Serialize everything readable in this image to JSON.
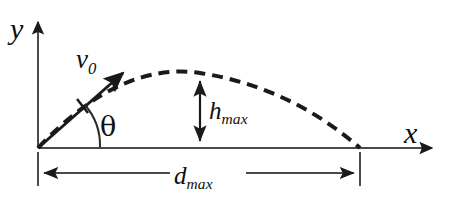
{
  "figure": {
    "background_color": "#ffffff",
    "stroke_color": "#3a3a3a",
    "label_color": "#101010",
    "width": 451,
    "height": 209
  },
  "axes": {
    "y_label": "y",
    "x_label": "x",
    "origin": {
      "x": 38,
      "y": 148
    },
    "y_axis_top": {
      "x": 38,
      "y": 15
    },
    "x_axis_right": {
      "x": 441,
      "y": 148
    }
  },
  "vectors": {
    "initial_velocity": {
      "label": "v",
      "subscript": "0",
      "angle_label": "θ",
      "tail": {
        "x": 38,
        "y": 148
      },
      "tip": {
        "x": 128,
        "y": 68
      },
      "angle_degrees": 41
    }
  },
  "dimensions": {
    "height": {
      "label": "h",
      "subscript": "max",
      "arrow_x": 200,
      "arrow_top_y": 75,
      "arrow_bottom_y": 147,
      "style": "double-headed-vertical"
    },
    "range": {
      "label": "d",
      "subscript": "max",
      "line_y": 173,
      "left_x": 38,
      "right_x": 360,
      "style": "double-headed-horizontal-with-extension-ticks"
    }
  },
  "trajectory": {
    "style": "dashed",
    "launch_point": {
      "x": 38,
      "y": 148
    },
    "apex": {
      "x": 200,
      "y": 73
    },
    "landing_point": {
      "x": 360,
      "y": 148
    },
    "path_points": [
      {
        "x": 38,
        "y": 148
      },
      {
        "x": 70,
        "y": 122
      },
      {
        "x": 105,
        "y": 102
      },
      {
        "x": 140,
        "y": 87
      },
      {
        "x": 170,
        "y": 78
      },
      {
        "x": 200,
        "y": 73
      },
      {
        "x": 232,
        "y": 76
      },
      {
        "x": 265,
        "y": 87
      },
      {
        "x": 300,
        "y": 104
      },
      {
        "x": 332,
        "y": 125
      },
      {
        "x": 360,
        "y": 148
      }
    ]
  }
}
